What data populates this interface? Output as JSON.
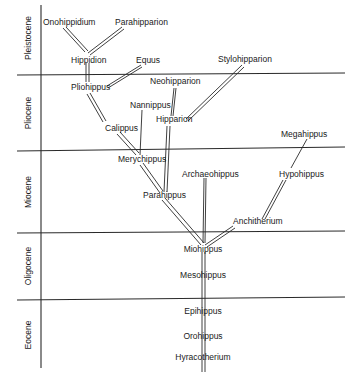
{
  "epochs": [
    {
      "label": "Pleistocene"
    },
    {
      "label": "Pliocene"
    },
    {
      "label": "Miocene"
    },
    {
      "label": "Oligocene"
    },
    {
      "label": "Eocene"
    }
  ],
  "taxa": {
    "onohippidium": "Onohippidium",
    "parahipparion": "Parahipparion",
    "hippidion": "Hippidion",
    "equus": "Equus",
    "stylohipparion": "Stylohipparion",
    "pliohippus": "Pliohippus",
    "neohipparion": "Neohipparion",
    "nannippus": "Nannippus",
    "hipparion": "Hipparion",
    "calippus": "Calippus",
    "megahippus": "Megahippus",
    "merychippus": "Merychippus",
    "archaeohippus": "Archaeohippus",
    "hypohippus": "Hypohippus",
    "parahippus": "Parahippus",
    "anchitherium": "Anchitherium",
    "miohippus": "Miohippus",
    "mesohippus": "Mesohippus",
    "epihippus": "Epihippus",
    "orohippus": "Orohippus",
    "hyracotherium": "Hyracotherium"
  },
  "colors": {
    "ink": "#1a1a1a",
    "background": "#ffffff"
  }
}
